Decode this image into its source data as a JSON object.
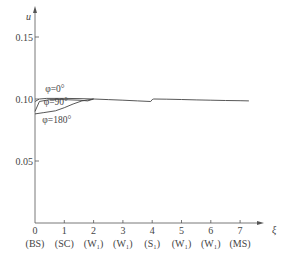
{
  "chart_data": {
    "type": "line",
    "title": "",
    "xlabel": "ξ",
    "ylabel": "u",
    "xlim": [
      0,
      7.5
    ],
    "ylim": [
      0,
      0.17
    ],
    "grid": false,
    "x_ticks": [
      {
        "value": 0,
        "label": "0",
        "sublabel": "(BS)"
      },
      {
        "value": 1,
        "label": "1",
        "sublabel": "(SC)"
      },
      {
        "value": 2,
        "label": "2",
        "sublabel": "(W₁)"
      },
      {
        "value": 3,
        "label": "3",
        "sublabel": "(W₁)"
      },
      {
        "value": 4,
        "label": "4",
        "sublabel": "(S₁)"
      },
      {
        "value": 5,
        "label": "5",
        "sublabel": "(W₁)"
      },
      {
        "value": 6,
        "label": "6",
        "sublabel": "(W₁)"
      },
      {
        "value": 7,
        "label": "7",
        "sublabel": "(MS)"
      }
    ],
    "y_ticks": [
      {
        "value": 0.05,
        "label": "0.05"
      },
      {
        "value": 0.1,
        "label": "0.10"
      },
      {
        "value": 0.15,
        "label": "0.15"
      }
    ],
    "series": [
      {
        "name": "φ=0°",
        "x": [
          0,
          0.15,
          0.4,
          1.0,
          1.5,
          2.0,
          2.5,
          3.0,
          3.5,
          3.95,
          4.0,
          4.05,
          4.5,
          5.0,
          5.5,
          6.0,
          6.5,
          7.0,
          7.3
        ],
        "y": [
          0.098,
          0.1,
          0.1005,
          0.1005,
          0.1003,
          0.1,
          0.0995,
          0.099,
          0.0985,
          0.098,
          0.0995,
          0.1,
          0.0998,
          0.0996,
          0.0993,
          0.099,
          0.0988,
          0.0986,
          0.0985
        ]
      },
      {
        "name": "φ=90°",
        "x": [
          0,
          0.15,
          0.5,
          1.0,
          1.5,
          1.8,
          2.0
        ],
        "y": [
          0.09,
          0.098,
          0.0995,
          0.0995,
          0.099,
          0.0985,
          0.1
        ]
      },
      {
        "name": "φ=180°",
        "x": [
          0,
          0.3,
          0.7,
          1.0,
          1.3,
          1.6,
          2.0
        ],
        "y": [
          0.088,
          0.089,
          0.0905,
          0.093,
          0.096,
          0.0985,
          0.1
        ]
      }
    ],
    "annotations": [
      {
        "text": "φ=0°",
        "x": 0.35,
        "y": 0.106
      },
      {
        "text": "φ=90°",
        "x": 0.3,
        "y": 0.095
      },
      {
        "text": "φ=180°",
        "x": 0.25,
        "y": 0.081
      }
    ]
  }
}
